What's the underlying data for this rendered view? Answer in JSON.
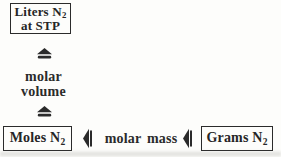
{
  "boxes": {
    "liters": {
      "line1_main": "Liters N",
      "line1_sub": "2",
      "line2": "at STP"
    },
    "moles": {
      "main": "Moles N",
      "sub": "2"
    },
    "grams": {
      "main": "Grams N",
      "sub": "2"
    }
  },
  "labels": {
    "vertical_line1": "molar",
    "vertical_line2": "volume",
    "horizontal": "molar mass"
  },
  "icons": {
    "vertical_arrow": "two-way-conversion-arrow-up",
    "horizontal_arrow": "two-way-conversion-arrow-left"
  },
  "colors": {
    "ink": "#262626",
    "border": "#2b2b2b",
    "background": "#fdfdfb"
  }
}
